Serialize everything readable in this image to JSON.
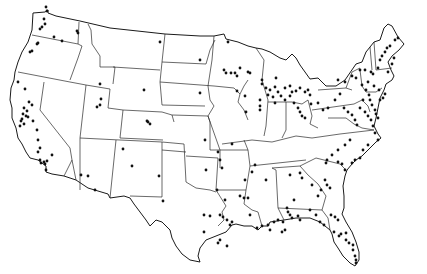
{
  "map": {
    "subject": "Contiguous United States with state boundaries",
    "marker_style": "small black dots",
    "colors": {
      "background": "#ffffff",
      "lines": "#1a1a1a",
      "markers": "#111111"
    },
    "points": [
      [
        46,
        7
      ],
      [
        47,
        11
      ],
      [
        44,
        19
      ],
      [
        45,
        24
      ],
      [
        42,
        27
      ],
      [
        40,
        29
      ],
      [
        54,
        37
      ],
      [
        62,
        41
      ],
      [
        77,
        31
      ],
      [
        78,
        33
      ],
      [
        38,
        43
      ],
      [
        37,
        44
      ],
      [
        32,
        51
      ],
      [
        30,
        52
      ],
      [
        18,
        82
      ],
      [
        25,
        89
      ],
      [
        29,
        102
      ],
      [
        32,
        105
      ],
      [
        24,
        108
      ],
      [
        27,
        111
      ],
      [
        23,
        114
      ],
      [
        26,
        116
      ],
      [
        22,
        119
      ],
      [
        21,
        121
      ],
      [
        24,
        124
      ],
      [
        20,
        126
      ],
      [
        28,
        117
      ],
      [
        33,
        121
      ],
      [
        37,
        130
      ],
      [
        38,
        140
      ],
      [
        40,
        148
      ],
      [
        38,
        152
      ],
      [
        40,
        160
      ],
      [
        41,
        163
      ],
      [
        44,
        162
      ],
      [
        47,
        161
      ],
      [
        52,
        155
      ],
      [
        46,
        170
      ],
      [
        45,
        164
      ],
      [
        100,
        84
      ],
      [
        101,
        99
      ],
      [
        97,
        107
      ],
      [
        100,
        105
      ],
      [
        144,
        90
      ],
      [
        148,
        122
      ],
      [
        150,
        124
      ],
      [
        147,
        121
      ],
      [
        81,
        175
      ],
      [
        88,
        176
      ],
      [
        95,
        190
      ],
      [
        123,
        149
      ],
      [
        132,
        166
      ],
      [
        159,
        176
      ],
      [
        163,
        201
      ],
      [
        160,
        42
      ],
      [
        200,
        60
      ],
      [
        200,
        93
      ],
      [
        228,
        42
      ],
      [
        224,
        70
      ],
      [
        226,
        73
      ],
      [
        237,
        91
      ],
      [
        245,
        96
      ],
      [
        246,
        112
      ],
      [
        260,
        110
      ],
      [
        260,
        106
      ],
      [
        275,
        103
      ],
      [
        276,
        78
      ],
      [
        260,
        100
      ],
      [
        235,
        73
      ],
      [
        237,
        76
      ],
      [
        231,
        73
      ],
      [
        240,
        68
      ],
      [
        248,
        72
      ],
      [
        250,
        73
      ],
      [
        262,
        80
      ],
      [
        262,
        84
      ],
      [
        266,
        88
      ],
      [
        270,
        90
      ],
      [
        268,
        95
      ],
      [
        273,
        97
      ],
      [
        285,
        100
      ],
      [
        290,
        96
      ],
      [
        296,
        91
      ],
      [
        300,
        88
      ],
      [
        305,
        92
      ],
      [
        308,
        90
      ],
      [
        310,
        95
      ],
      [
        275,
        87
      ],
      [
        278,
        92
      ],
      [
        281,
        96
      ],
      [
        285,
        88
      ],
      [
        290,
        86
      ],
      [
        292,
        92
      ],
      [
        294,
        103
      ],
      [
        298,
        108
      ],
      [
        300,
        112
      ],
      [
        302,
        116
      ],
      [
        305,
        118
      ],
      [
        311,
        104
      ],
      [
        318,
        103
      ],
      [
        323,
        110
      ],
      [
        328,
        108
      ],
      [
        335,
        100
      ],
      [
        340,
        94
      ],
      [
        344,
        108
      ],
      [
        348,
        112
      ],
      [
        352,
        115
      ],
      [
        355,
        120
      ],
      [
        357,
        125
      ],
      [
        338,
        80
      ],
      [
        345,
        82
      ],
      [
        352,
        76
      ],
      [
        356,
        78
      ],
      [
        360,
        70
      ],
      [
        365,
        70
      ],
      [
        371,
        72
      ],
      [
        373,
        74
      ],
      [
        378,
        68
      ],
      [
        380,
        60
      ],
      [
        382,
        56
      ],
      [
        385,
        52
      ],
      [
        387,
        48
      ],
      [
        390,
        46
      ],
      [
        395,
        40
      ],
      [
        398,
        38
      ],
      [
        394,
        58
      ],
      [
        392,
        64
      ],
      [
        388,
        72
      ],
      [
        362,
        85
      ],
      [
        366,
        90
      ],
      [
        369,
        95
      ],
      [
        370,
        100
      ],
      [
        372,
        105
      ],
      [
        375,
        110
      ],
      [
        376,
        114
      ],
      [
        378,
        118
      ],
      [
        380,
        100
      ],
      [
        383,
        98
      ],
      [
        385,
        94
      ],
      [
        379,
        90
      ],
      [
        374,
        86
      ],
      [
        368,
        82
      ],
      [
        363,
        100
      ],
      [
        360,
        108
      ],
      [
        365,
        112
      ],
      [
        368,
        116
      ],
      [
        371,
        120
      ],
      [
        373,
        126
      ],
      [
        375,
        133
      ],
      [
        378,
        140
      ],
      [
        350,
        140
      ],
      [
        345,
        145
      ],
      [
        338,
        150
      ],
      [
        332,
        155
      ],
      [
        327,
        160
      ],
      [
        326,
        163
      ],
      [
        338,
        162
      ],
      [
        342,
        164
      ],
      [
        345,
        170
      ],
      [
        352,
        163
      ],
      [
        355,
        160
      ],
      [
        360,
        158
      ],
      [
        363,
        150
      ],
      [
        368,
        145
      ],
      [
        325,
        180
      ],
      [
        327,
        185
      ],
      [
        330,
        188
      ],
      [
        321,
        190
      ],
      [
        318,
        196
      ],
      [
        312,
        185
      ],
      [
        300,
        173
      ],
      [
        302,
        178
      ],
      [
        290,
        175
      ],
      [
        294,
        200
      ],
      [
        287,
        208
      ],
      [
        288,
        212
      ],
      [
        290,
        215
      ],
      [
        292,
        218
      ],
      [
        298,
        216
      ],
      [
        300,
        220
      ],
      [
        310,
        210
      ],
      [
        316,
        215
      ],
      [
        255,
        165
      ],
      [
        252,
        172
      ],
      [
        244,
        198
      ],
      [
        266,
        180
      ],
      [
        257,
        228
      ],
      [
        262,
        226
      ],
      [
        268,
        225
      ],
      [
        270,
        230
      ],
      [
        274,
        222
      ],
      [
        278,
        220
      ],
      [
        283,
        222
      ],
      [
        285,
        230
      ],
      [
        282,
        232
      ],
      [
        232,
        144
      ],
      [
        245,
        180
      ],
      [
        240,
        196
      ],
      [
        248,
        198
      ],
      [
        250,
        215
      ],
      [
        220,
        215
      ],
      [
        223,
        217
      ],
      [
        227,
        220
      ],
      [
        230,
        225
      ],
      [
        232,
        222
      ],
      [
        204,
        215
      ],
      [
        210,
        216
      ],
      [
        204,
        232
      ],
      [
        227,
        246
      ],
      [
        218,
        243
      ],
      [
        220,
        240
      ],
      [
        205,
        140
      ],
      [
        218,
        152
      ],
      [
        220,
        160
      ],
      [
        222,
        168
      ],
      [
        217,
        190
      ],
      [
        225,
        200
      ],
      [
        206,
        170
      ],
      [
        331,
        215
      ],
      [
        335,
        217
      ],
      [
        338,
        220
      ],
      [
        339,
        236
      ],
      [
        341,
        234
      ],
      [
        346,
        240
      ],
      [
        349,
        243
      ],
      [
        353,
        245
      ],
      [
        353,
        250
      ],
      [
        355,
        256
      ],
      [
        356,
        260
      ],
      [
        356,
        263
      ],
      [
        320,
        222
      ],
      [
        324,
        225
      ],
      [
        334,
        232
      ],
      [
        346,
        233
      ]
    ]
  }
}
